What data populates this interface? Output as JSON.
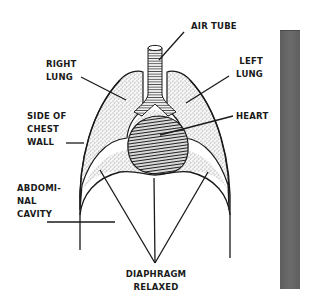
{
  "diagram": {
    "labels": {
      "air_tube": "AIR TUBE",
      "right_lung": [
        "RIGHT",
        "LUNG"
      ],
      "left_lung": [
        "LEFT",
        "LUNG"
      ],
      "heart": "HEART",
      "side_of_chest_wall": [
        "SIDE OF",
        "CHEST",
        "WALL"
      ],
      "abdominal_cavity": [
        "ABDOMI-",
        "NAL",
        "CAVITY"
      ],
      "diaphragm": [
        "DIAPHRAGM",
        "RELAXED"
      ]
    },
    "colors": {
      "ink": "#1a1a1a",
      "background": "#ffffff",
      "side_bar": "#666666"
    },
    "fills": {
      "lungs": "stippled",
      "heart": "hatched",
      "air_tube": "ringed"
    }
  }
}
